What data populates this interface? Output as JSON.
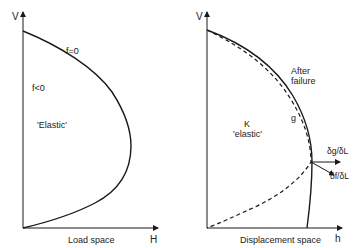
{
  "left_panel": {
    "y_axis_label": "V",
    "x_axis_label": "H",
    "caption": "Load space",
    "curve_label": "f=0",
    "region_label": "f<0",
    "region_name": "'Elastic'"
  },
  "right_panel": {
    "y_axis_label": "V",
    "x_axis_label": "h",
    "caption": "Displacement space",
    "annotation": "After\nfailure",
    "annotation_line1": "After",
    "annotation_line2": "failure",
    "curve_label": "g",
    "region_symbol": "K",
    "region_name": "'elastic'",
    "vector1_label": "δg/δL",
    "vector2_label": "δf/δL"
  },
  "colors": {
    "line": "#1a1a1a",
    "background": "#ffffff"
  }
}
